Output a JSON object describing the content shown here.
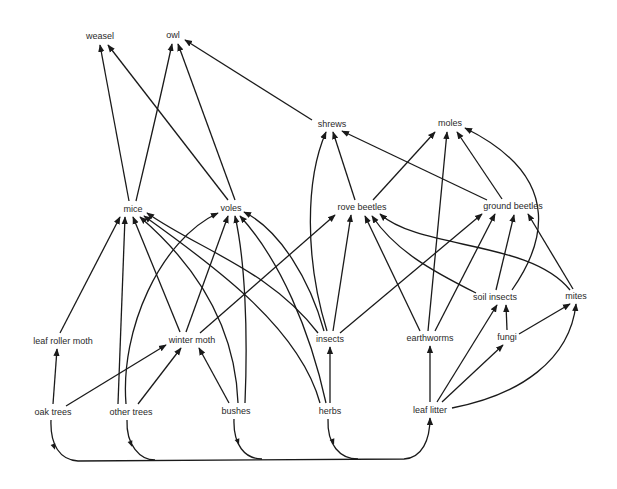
{
  "style": {
    "line_color": "#1a1a1a",
    "text_color": "#2a2a2a",
    "background": "#ffffff"
  },
  "nodes": [
    {
      "id": "weasel",
      "label": "weasel",
      "x": 100,
      "y": 36
    },
    {
      "id": "owl",
      "label": "owl",
      "x": 173,
      "y": 35
    },
    {
      "id": "shrews",
      "label": "shrews",
      "x": 332,
      "y": 124
    },
    {
      "id": "moles",
      "label": "moles",
      "x": 450,
      "y": 123
    },
    {
      "id": "mice",
      "label": "mice",
      "x": 133,
      "y": 209
    },
    {
      "id": "voles",
      "label": "voles",
      "x": 231,
      "y": 208
    },
    {
      "id": "rove_beetles",
      "label": "rove beetles",
      "x": 362,
      "y": 207
    },
    {
      "id": "ground_beetles",
      "label": "ground beetles",
      "x": 513,
      "y": 206
    },
    {
      "id": "soil_insects",
      "label": "soil insects",
      "x": 495,
      "y": 297
    },
    {
      "id": "mites",
      "label": "mites",
      "x": 576,
      "y": 296
    },
    {
      "id": "leaf_roller_moth",
      "label": "leaf roller moth",
      "x": 63,
      "y": 341
    },
    {
      "id": "winter_moth",
      "label": "winter moth",
      "x": 192,
      "y": 340
    },
    {
      "id": "insects",
      "label": "insects",
      "x": 330,
      "y": 339
    },
    {
      "id": "earthworms",
      "label": "earthworms",
      "x": 430,
      "y": 338
    },
    {
      "id": "fungi",
      "label": "fungi",
      "x": 507,
      "y": 337
    },
    {
      "id": "oak_trees",
      "label": "oak trees",
      "x": 53,
      "y": 412
    },
    {
      "id": "other_trees",
      "label": "other trees",
      "x": 131,
      "y": 412
    },
    {
      "id": "bushes",
      "label": "bushes",
      "x": 236,
      "y": 411
    },
    {
      "id": "herbs",
      "label": "herbs",
      "x": 330,
      "y": 411
    },
    {
      "id": "leaf_litter",
      "label": "leaf litter",
      "x": 430,
      "y": 410
    }
  ],
  "edges": [
    {
      "from": "mice",
      "to": "weasel",
      "d": "M129,201 L100,45"
    },
    {
      "from": "voles",
      "to": "weasel",
      "d": "M228,200 L108,45"
    },
    {
      "from": "mice",
      "to": "owl",
      "d": "M136,201 C148,150 160,100 172,44"
    },
    {
      "from": "voles",
      "to": "owl",
      "d": "M235,200 L178,44"
    },
    {
      "from": "shrews",
      "to": "owl",
      "d": "M312,120 L185,40"
    },
    {
      "from": "rove_beetles",
      "to": "shrews",
      "d": "M355,200 L333,132"
    },
    {
      "from": "ground_beetles",
      "to": "shrews",
      "d": "M487,200 L342,131"
    },
    {
      "from": "insects",
      "to": "shrews",
      "d": "M327,331 C305,260 305,180 326,132"
    },
    {
      "from": "rove_beetles",
      "to": "moles",
      "d": "M373,200 L435,132"
    },
    {
      "from": "earthworms",
      "to": "moles",
      "d": "M428,331 L447,132"
    },
    {
      "from": "ground_beetles",
      "to": "moles",
      "d": "M502,199 L457,132"
    },
    {
      "from": "soil_insects",
      "to": "moles",
      "d": "M512,290 C540,250 570,180 465,128"
    },
    {
      "from": "insects",
      "to": "rove_beetles",
      "d": "M333,331 L351,215"
    },
    {
      "from": "winter_moth",
      "to": "rove_beetles",
      "d": "M200,333 L335,215"
    },
    {
      "from": "earthworms",
      "to": "rove_beetles",
      "d": "M420,331 L365,216"
    },
    {
      "from": "soil_insects",
      "to": "rove_beetles",
      "d": "M476,293 C430,270 395,250 372,216"
    },
    {
      "from": "mites",
      "to": "rove_beetles",
      "d": "M570,290 C530,240 420,250 380,214"
    },
    {
      "from": "insects",
      "to": "ground_beetles",
      "d": "M340,333 L482,214"
    },
    {
      "from": "earthworms",
      "to": "ground_beetles",
      "d": "M435,331 L495,214"
    },
    {
      "from": "soil_insects",
      "to": "ground_beetles",
      "d": "M496,290 L514,215"
    },
    {
      "from": "mites",
      "to": "ground_beetles",
      "d": "M573,289 L528,214"
    },
    {
      "from": "fungi",
      "to": "soil_insects",
      "d": "M507,330 L506,305"
    },
    {
      "from": "leaf_litter",
      "to": "soil_insects",
      "d": "M437,402 L497,305"
    },
    {
      "from": "fungi",
      "to": "mites",
      "d": "M519,334 L570,304"
    },
    {
      "from": "leaf_litter",
      "to": "mites",
      "d": "M452,408 C520,395 570,360 576,304"
    },
    {
      "from": "leaf_litter",
      "to": "fungi",
      "d": "M442,402 L503,345"
    },
    {
      "from": "leaf_litter",
      "to": "earthworms",
      "d": "M430,402 L430,346"
    },
    {
      "from": "herbs",
      "to": "insects",
      "d": "M330,403 L330,347"
    },
    {
      "from": "leaf_roller_moth",
      "to": "mice",
      "d": "M60,333 L120,217"
    },
    {
      "from": "other_trees",
      "to": "mice",
      "d": "M118,404 L125,217"
    },
    {
      "from": "winter_moth",
      "to": "mice",
      "d": "M180,332 L133,217"
    },
    {
      "from": "bushes",
      "to": "mice",
      "d": "M238,403 C235,320 190,260 140,217"
    },
    {
      "from": "herbs",
      "to": "mice",
      "d": "M320,403 C300,330 220,270 144,216"
    },
    {
      "from": "insects",
      "to": "mice",
      "d": "M318,333 C270,270 200,250 147,213"
    },
    {
      "from": "other_trees",
      "to": "voles",
      "d": "M126,404 C120,330 160,240 218,213"
    },
    {
      "from": "winter_moth",
      "to": "voles",
      "d": "M186,332 L228,216"
    },
    {
      "from": "bushes",
      "to": "voles",
      "d": "M245,403 C248,330 245,260 235,216"
    },
    {
      "from": "herbs",
      "to": "voles",
      "d": "M326,403 C310,330 280,260 240,216"
    },
    {
      "from": "insects",
      "to": "voles",
      "d": "M324,331 C310,280 280,230 244,212"
    },
    {
      "from": "oak_trees",
      "to": "leaf_roller_moth",
      "d": "M53,404 L57,349"
    },
    {
      "from": "oak_trees",
      "to": "winter_moth",
      "d": "M66,406 L166,345"
    },
    {
      "from": "other_trees",
      "to": "winter_moth",
      "d": "M138,404 L181,348"
    },
    {
      "from": "bushes",
      "to": "winter_moth",
      "d": "M229,403 L199,348"
    },
    {
      "from": "oak_trees",
      "to": "leaf_litter",
      "d": "M51,420 C50,445 60,460 78,461 L404,459 C422,458 430,440 430,418"
    },
    {
      "from": "other_trees",
      "to": "leaf_litter",
      "d": "M127,420 C126,445 140,460 155,460"
    },
    {
      "from": "bushes",
      "to": "leaf_litter",
      "d": "M234,419 C233,445 245,459 262,459"
    },
    {
      "from": "herbs",
      "to": "leaf_litter",
      "d": "M328,419 C327,445 340,459 358,459"
    }
  ],
  "mid_arrows": [
    {
      "x": 54,
      "y": 447,
      "angle": 70
    },
    {
      "x": 131,
      "y": 444,
      "angle": 70
    },
    {
      "x": 238,
      "y": 442,
      "angle": 70
    },
    {
      "x": 333,
      "y": 442,
      "angle": 70
    }
  ]
}
